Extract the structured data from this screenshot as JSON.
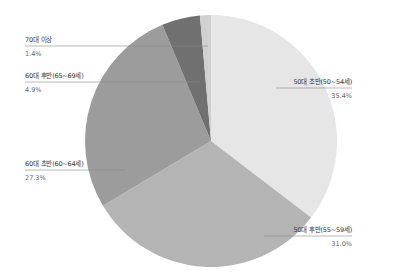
{
  "chart_data": {
    "type": "pie",
    "title": "",
    "start_angle": "12 o'clock",
    "direction": "clockwise",
    "legend": "none (direct labels with leader lines)",
    "slices": [
      {
        "label": "50대 초반(50~54세)",
        "value": 35.4,
        "value_label": "35.4%",
        "color": "#e6e6e6"
      },
      {
        "label": "50대 후반(55~59세)",
        "value": 31.0,
        "value_label": "31.0%",
        "color": "#b4b4b4"
      },
      {
        "label": "60대 초반(60~64세)",
        "value": 27.3,
        "value_label": "27.3%",
        "color": "#9c9c9c"
      },
      {
        "label": "60대 후반(65~69세)",
        "value": 4.9,
        "value_label": "4.9%",
        "color": "#707070"
      },
      {
        "label": "70대 이상",
        "value": 1.4,
        "value_label": "1.4%",
        "color": "#d0d0d0"
      }
    ]
  },
  "labels": {
    "s0": {
      "name": "50대 초반(50~54세)",
      "pct": "35.4%"
    },
    "s1": {
      "name": "50대 후반(55~59세)",
      "pct": "31.0%"
    },
    "s2": {
      "name": "60대 초반(60~64세)",
      "pct": "27.3%"
    },
    "s3": {
      "name": "60대 후반(65~69세)",
      "pct": "4.9%"
    },
    "s4": {
      "name": "70대 이상",
      "pct": "1.4%"
    }
  }
}
